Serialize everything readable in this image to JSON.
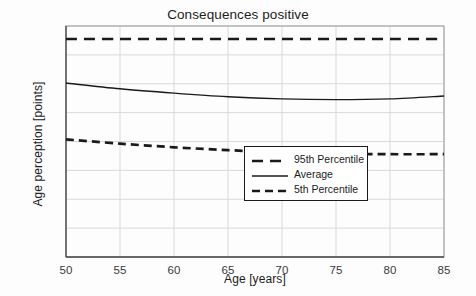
{
  "chart_data": {
    "type": "line",
    "title": "Consequences positive",
    "xlabel": "Age [years]",
    "ylabel": "Age perception [points]",
    "xlim": [
      50,
      85
    ],
    "ylim": [
      0,
      16
    ],
    "xticks": [
      50,
      55,
      60,
      65,
      70,
      75,
      80,
      85
    ],
    "yticks": [
      0,
      2,
      4,
      6,
      8,
      10,
      12,
      14,
      16
    ],
    "grid": true,
    "legend_position": "lower right",
    "x": [
      50,
      55,
      60,
      65,
      70,
      75,
      80,
      85
    ],
    "series": [
      {
        "name": "95th Percentile",
        "style": "dashed",
        "color": "#1a1a1a",
        "values": [
          15.1,
          15.1,
          15.1,
          15.1,
          15.1,
          15.1,
          15.1,
          15.1
        ]
      },
      {
        "name": "Average",
        "style": "solid",
        "color": "#1a1a1a",
        "values": [
          12.05,
          11.65,
          11.35,
          11.1,
          10.95,
          10.9,
          10.95,
          11.15
        ]
      },
      {
        "name": "5th Percentile",
        "style": "dashed",
        "color": "#1a1a1a",
        "values": [
          8.15,
          7.85,
          7.6,
          7.4,
          7.25,
          7.15,
          7.12,
          7.12
        ]
      }
    ]
  },
  "colors": {
    "ink": "#1a1a1a",
    "grid": "#d9d9d9",
    "axis": "#9a9a9a",
    "background": "#fdfdfd"
  }
}
